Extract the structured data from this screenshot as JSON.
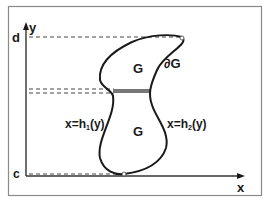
{
  "diagram": {
    "axes": {
      "x_label": "x",
      "y_label": "y"
    },
    "bounds": {
      "top_label": "d",
      "bottom_label": "c"
    },
    "region": {
      "upper_label": "G",
      "lower_label": "G",
      "boundary_label": "∂G"
    },
    "boundary_functions": {
      "left": {
        "prefix": "x=h",
        "subscript": "1",
        "suffix": "(y)"
      },
      "right": {
        "prefix": "x=h",
        "subscript": "2",
        "suffix": "(y)"
      }
    },
    "colors": {
      "stroke": "#1a1a1a",
      "frame": "#888888",
      "strip": "#777777",
      "dashed": "#444444"
    }
  }
}
